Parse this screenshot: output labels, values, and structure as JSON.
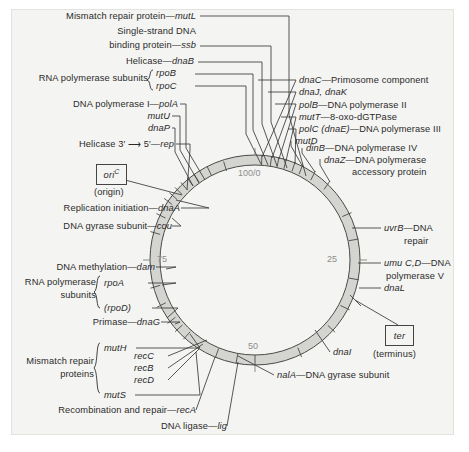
{
  "figure": {
    "background_color": "#f4f4f2",
    "ring_color": "#d6d6d2",
    "line_color": "#3a3a3a",
    "tick_text_color": "#8d8d8d"
  },
  "map": {
    "center_x": 255,
    "center_y": 260,
    "outer_radius": 105,
    "inner_radius": 95,
    "scale_ticks": [
      {
        "label": "100/0",
        "position_minutes": 0,
        "x": 242,
        "y": 168
      },
      {
        "label": "25",
        "position_minutes": 25,
        "x": 327,
        "y": 258
      },
      {
        "label": "50",
        "position_minutes": 50,
        "x": 248,
        "y": 342
      },
      {
        "label": "75",
        "position_minutes": 75,
        "x": 158,
        "y": 258
      }
    ]
  },
  "markers": {
    "origin": {
      "gene": "oriC",
      "gene_italic": "oriC",
      "caption": "(origin)"
    },
    "terminus": {
      "gene": "ter",
      "caption": "(terminus)"
    }
  },
  "labels_left": [
    {
      "id": "mutL",
      "text": "Mismatch repair protein",
      "gene": "mutL",
      "dash": "—"
    },
    {
      "id": "ssb",
      "text_line1": "Single-strand DNA",
      "text_line2": "binding protein",
      "gene": "ssb",
      "dash": "—"
    },
    {
      "id": "dnaB",
      "text": "Helicase",
      "gene": "dnaB",
      "dash": "—"
    },
    {
      "id": "rpo",
      "text": "RNA polymerase subunits",
      "genes": [
        "rpoB",
        "rpoC"
      ]
    },
    {
      "id": "polA",
      "text": "DNA polymerase I",
      "gene": "polA",
      "dash": "—"
    },
    {
      "id": "mutU",
      "text": "",
      "gene": "mutU"
    },
    {
      "id": "dnaP",
      "text": "",
      "gene": "dnaP"
    },
    {
      "id": "rep",
      "text": "Helicase 3′ ⟶ 5′",
      "gene": "rep",
      "dash": "—"
    },
    {
      "id": "dnaA",
      "text": "Replication initiation",
      "gene": "dnaA",
      "dash": "—"
    },
    {
      "id": "cou",
      "text": "DNA gyrase subunit",
      "gene": "cou",
      "dash": "—"
    },
    {
      "id": "dam",
      "text": "DNA methylation",
      "gene": "dam",
      "dash": "—"
    },
    {
      "id": "rpoAD",
      "text_line1": "RNA polymerase",
      "text_line2": "subunits",
      "genes": [
        "rpoA",
        "(rpoD)"
      ]
    },
    {
      "id": "dnaG",
      "text": "Primase",
      "gene": "dnaG",
      "dash": "—"
    },
    {
      "id": "mismatch",
      "text_line1": "Mismatch repair",
      "text_line2": "proteins",
      "genes": [
        "mutH",
        "mutS"
      ]
    },
    {
      "id": "rec",
      "genes": [
        "recC",
        "recB",
        "recD"
      ]
    },
    {
      "id": "recA",
      "text": "Recombination and repair",
      "gene": "recA",
      "dash": "—"
    },
    {
      "id": "lig",
      "text": "DNA ligase",
      "gene": "lig",
      "dash": "—"
    }
  ],
  "labels_right": [
    {
      "id": "dnaC",
      "gene": "dnaC",
      "dash": "—",
      "text": "Primosome component"
    },
    {
      "id": "dnaJK",
      "gene": "dnaJ, dnaK",
      "dash": "",
      "text": ""
    },
    {
      "id": "polB",
      "gene": "polB",
      "dash": "—",
      "text": "DNA polymerase II"
    },
    {
      "id": "mutT",
      "gene": "mutT",
      "dash": "—",
      "text": "8-oxo-dGTPase"
    },
    {
      "id": "polC",
      "gene": "polC (dnaE)",
      "dash": "—",
      "text": "DNA polymerase III"
    },
    {
      "id": "mutD",
      "gene": "mutD",
      "dash": "",
      "text": ""
    },
    {
      "id": "dinB",
      "gene": "dinB",
      "dash": "—",
      "text": "DNA polymerase IV"
    },
    {
      "id": "dnaZ",
      "gene": "dnaZ",
      "dash": "—",
      "text_line1": "DNA polymerase",
      "text_line2": "accessory protein"
    },
    {
      "id": "uvrB",
      "gene": "uvrB",
      "dash": "—",
      "text_line1": "DNA",
      "text_line2": "repair"
    },
    {
      "id": "umuCD",
      "gene": "umu C,D",
      "dash": "—",
      "text_line1": "DNA",
      "text_line2": "polymerase V"
    },
    {
      "id": "dnaL",
      "gene": "dnaL",
      "dash": "",
      "text": ""
    },
    {
      "id": "dnaI",
      "gene": "dnaI",
      "dash": "",
      "text": ""
    },
    {
      "id": "nalA",
      "gene": "nalA",
      "dash": "—",
      "text": "DNA gyrase subunit"
    }
  ]
}
